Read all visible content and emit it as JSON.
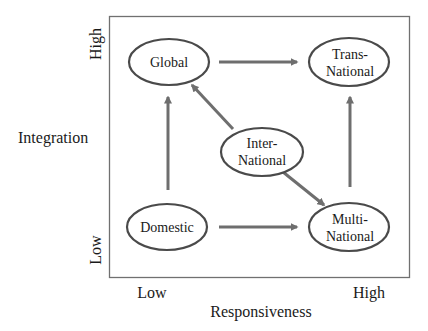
{
  "diagram": {
    "colors": {
      "frame": "#707070",
      "ellipse_stroke": "#4a4a4a",
      "arrow": "#6e6e6e",
      "text": "#1a1a1a",
      "background": "#ffffff"
    },
    "y_axis": {
      "title": "Integration",
      "high_label": "High",
      "low_label": "Low"
    },
    "x_axis": {
      "title": "Responsiveness",
      "low_label": "Low",
      "high_label": "High"
    },
    "nodes": {
      "global": {
        "lines": [
          "Global"
        ]
      },
      "transnational": {
        "lines": [
          "Trans-",
          "National"
        ]
      },
      "international": {
        "lines": [
          "Inter-",
          "National"
        ]
      },
      "domestic": {
        "lines": [
          "Domestic"
        ]
      },
      "multinational": {
        "lines": [
          "Multi-",
          "National"
        ]
      }
    },
    "edges": [
      {
        "from": "Global",
        "to": "Trans-National"
      },
      {
        "from": "Domestic",
        "to": "Global"
      },
      {
        "from": "Inter-National",
        "to": "Global"
      },
      {
        "from": "Inter-National",
        "to": "Multi-National"
      },
      {
        "from": "Domestic",
        "to": "Multi-National"
      },
      {
        "from": "Multi-National",
        "to": "Trans-National"
      }
    ]
  }
}
